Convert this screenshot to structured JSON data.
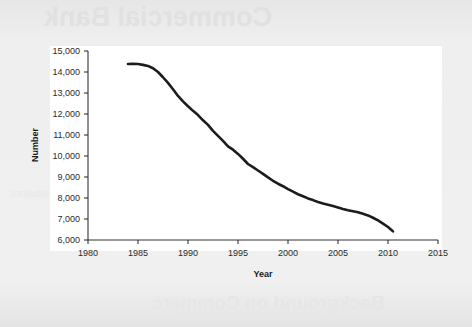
{
  "page": {
    "background_color": "#ebebeb",
    "card_color": "#ffffff",
    "ghost_text_top": "Commercial Bank",
    "ghost_text_bottom": "Background on Commerc",
    "ghost_text_bottom_sub": "the number of banks has been declining",
    "ghost_text_mid": "institutions"
  },
  "chart_data": {
    "type": "line",
    "title": "",
    "xlabel": "Year",
    "ylabel": "Number",
    "xlim": [
      1980,
      2015
    ],
    "ylim": [
      6000,
      15000
    ],
    "xticks": [
      1980,
      1985,
      1990,
      1995,
      2000,
      2005,
      2010,
      2015
    ],
    "xtick_labels": [
      "1980",
      "1985",
      "1990",
      "1995",
      "2000",
      "2005",
      "2010",
      "2015"
    ],
    "yticks": [
      6000,
      7000,
      8000,
      9000,
      10000,
      11000,
      12000,
      13000,
      14000,
      15000
    ],
    "ytick_labels": [
      "6,000",
      "7,000",
      "8,000",
      "9,000",
      "10,000",
      "11,000",
      "12,000",
      "13,000",
      "14,000",
      "15,000"
    ],
    "grid": false,
    "legend": null,
    "line_color": "#1c1c1c",
    "line_width": 2.6,
    "series": [
      {
        "name": "Number of commercial banks",
        "x": [
          1984.0,
          1984.5,
          1985.0,
          1985.5,
          1986.0,
          1986.5,
          1987.0,
          1987.5,
          1988.0,
          1988.5,
          1989.0,
          1989.5,
          1990.0,
          1990.5,
          1991.0,
          1991.5,
          1992.0,
          1992.5,
          1993.0,
          1993.5,
          1994.0,
          1994.5,
          1995.0,
          1995.5,
          1996.0,
          1996.5,
          1997.0,
          1997.5,
          1998.0,
          1998.5,
          1999.0,
          1999.5,
          2000.0,
          2000.5,
          2001.0,
          2001.5,
          2002.0,
          2002.5,
          2003.0,
          2003.5,
          2004.0,
          2004.5,
          2005.0,
          2005.5,
          2006.0,
          2006.5,
          2007.0,
          2007.5,
          2008.0,
          2008.5,
          2009.0,
          2009.5,
          2010.0,
          2010.5
        ],
        "y": [
          14380,
          14390,
          14380,
          14340,
          14290,
          14180,
          14000,
          13750,
          13480,
          13180,
          12860,
          12600,
          12370,
          12150,
          11950,
          11700,
          11480,
          11200,
          10960,
          10720,
          10460,
          10300,
          10100,
          9870,
          9620,
          9470,
          9310,
          9150,
          8980,
          8820,
          8680,
          8560,
          8420,
          8300,
          8180,
          8080,
          7980,
          7900,
          7810,
          7740,
          7680,
          7620,
          7550,
          7480,
          7420,
          7370,
          7320,
          7250,
          7170,
          7060,
          6930,
          6780,
          6620,
          6410
        ]
      }
    ]
  }
}
